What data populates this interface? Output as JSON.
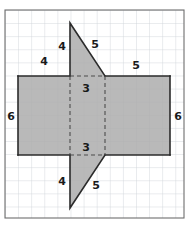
{
  "figure": {
    "name": "composite-figure-rectangle-with-two-triangles",
    "background_color": "#ffffff",
    "grid": {
      "line_color": "#cfd4da",
      "border_color": "#6e6e6e",
      "cell_size": 13.1,
      "columns": 13,
      "rows": 15.5,
      "origin_x": 5,
      "origin_y": 10,
      "width": 179,
      "height": 208
    },
    "shape_style": {
      "fill_color": "#adadad",
      "stroke_color": "#2b2b2b",
      "stroke_width": 1.6,
      "dash_color": "#4d4d4d",
      "dash_pattern": "4,3"
    },
    "rectangle": {
      "name": "central-rectangle",
      "x": 18,
      "y": 76,
      "width": 152,
      "height": 79,
      "left_side_length": "6",
      "right_side_length": "6",
      "top_left_segment_length": "4",
      "top_right_segment_length": "5"
    },
    "top_triangle": {
      "name": "upper-triangle",
      "apex_x": 70,
      "apex_y": 23,
      "base_left_x": 70,
      "base_right_x": 105,
      "base_y": 76,
      "vertical_leg_length": "4",
      "hypotenuse_length": "5",
      "base_length": "3"
    },
    "bottom_triangle": {
      "name": "lower-triangle",
      "apex_x": 70,
      "apex_y": 208,
      "base_left_x": 70,
      "base_right_x": 105,
      "base_y": 155,
      "vertical_leg_length": "4",
      "hypotenuse_length": "5",
      "base_length": "3"
    },
    "labels": [
      {
        "id": "top-triangle-vertical-leg",
        "text": "4",
        "x": 62,
        "y": 46
      },
      {
        "id": "top-triangle-hypotenuse",
        "text": "5",
        "x": 95,
        "y": 44
      },
      {
        "id": "rectangle-top-left-segment",
        "text": "4",
        "x": 44,
        "y": 61
      },
      {
        "id": "rectangle-top-right-segment",
        "text": "5",
        "x": 136,
        "y": 65
      },
      {
        "id": "top-triangle-base",
        "text": "3",
        "x": 86,
        "y": 88
      },
      {
        "id": "rectangle-left-side",
        "text": "6",
        "x": 11,
        "y": 116
      },
      {
        "id": "rectangle-right-side",
        "text": "6",
        "x": 178,
        "y": 116
      },
      {
        "id": "bottom-triangle-base",
        "text": "3",
        "x": 86,
        "y": 147
      },
      {
        "id": "bottom-triangle-vertical-leg",
        "text": "4",
        "x": 62,
        "y": 181
      },
      {
        "id": "bottom-triangle-hypotenuse",
        "text": "5",
        "x": 96,
        "y": 185
      }
    ]
  }
}
